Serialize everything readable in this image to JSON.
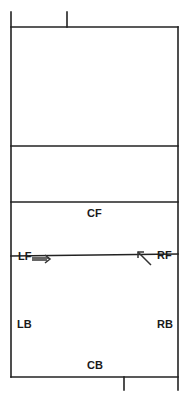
{
  "diagram": {
    "type": "volleyball-court-positions",
    "colors": {
      "line": "#222222",
      "text": "#1a1a1a",
      "background": "#ffffff"
    },
    "positions": {
      "cf": "CF",
      "lf": "LF",
      "rf": "RF",
      "lb": "LB",
      "rb": "RB",
      "cb": "CB"
    },
    "arrows": [
      {
        "from": "LF",
        "direction": "right",
        "name": "lf-movement-arrow"
      },
      {
        "from": "RF",
        "direction": "up-left",
        "name": "rf-movement-arrow"
      }
    ]
  }
}
